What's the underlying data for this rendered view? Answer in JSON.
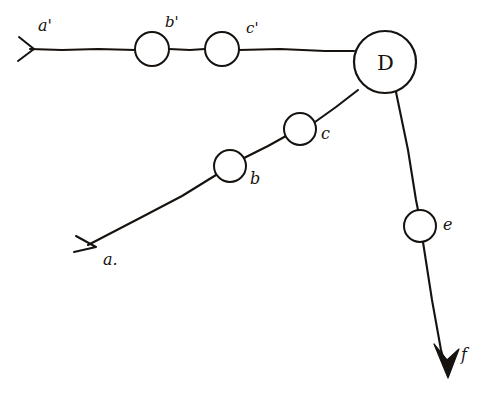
{
  "figure": {
    "background_color": "#ffffff",
    "ink_color": "#16120f",
    "width": 501,
    "height": 400
  },
  "nodes": [
    {
      "id": "b-prime",
      "label": "b'",
      "cx": 152,
      "cy": 49,
      "r": 17,
      "kind": "small-circle",
      "label_x": 165,
      "label_y": 27
    },
    {
      "id": "c-prime",
      "label": "c'",
      "cx": 222,
      "cy": 49,
      "r": 17,
      "kind": "small-circle",
      "label_x": 246,
      "label_y": 33
    },
    {
      "id": "d",
      "label": "D",
      "cx": 385,
      "cy": 62,
      "r": 31,
      "kind": "large-circle",
      "label_x": 377,
      "label_y": 70
    },
    {
      "id": "b",
      "label": "b",
      "cx": 230,
      "cy": 166,
      "r": 16,
      "kind": "small-circle",
      "label_x": 250,
      "label_y": 184
    },
    {
      "id": "c",
      "label": "c",
      "cx": 300,
      "cy": 129,
      "r": 16,
      "kind": "small-circle",
      "label_x": 321,
      "label_y": 139
    },
    {
      "id": "e",
      "label": "e",
      "cx": 420,
      "cy": 226,
      "r": 16,
      "kind": "small-circle",
      "label_x": 443,
      "label_y": 230
    }
  ],
  "arrows": [
    {
      "id": "a-prime",
      "label": "a'",
      "head_style": "open-chevron",
      "tip_x": 18,
      "tip_y": 49,
      "label_x": 38,
      "label_y": 31
    },
    {
      "id": "a",
      "label": "a.",
      "head_style": "open-chevron",
      "tip_x": 84,
      "tip_y": 244,
      "label_x": 103,
      "label_y": 265
    },
    {
      "id": "f",
      "label": "f",
      "head_style": "solid-triangle",
      "tip_x": 448,
      "tip_y": 377,
      "label_x": 461,
      "label_y": 360
    }
  ],
  "edges": [
    {
      "id": "edge-a-prime-to-b-prime",
      "from": "a-prime",
      "to": "b-prime"
    },
    {
      "id": "edge-b-prime-to-c-prime",
      "from": "b-prime",
      "to": "c-prime"
    },
    {
      "id": "edge-c-prime-to-d",
      "from": "c-prime",
      "to": "d"
    },
    {
      "id": "edge-a-to-b",
      "from": "a",
      "to": "b"
    },
    {
      "id": "edge-b-to-c",
      "from": "b",
      "to": "c"
    },
    {
      "id": "edge-c-to-d",
      "from": "c",
      "to": "d"
    },
    {
      "id": "edge-d-to-e",
      "from": "d",
      "to": "e"
    },
    {
      "id": "edge-e-to-f",
      "from": "e",
      "to": "f"
    }
  ]
}
